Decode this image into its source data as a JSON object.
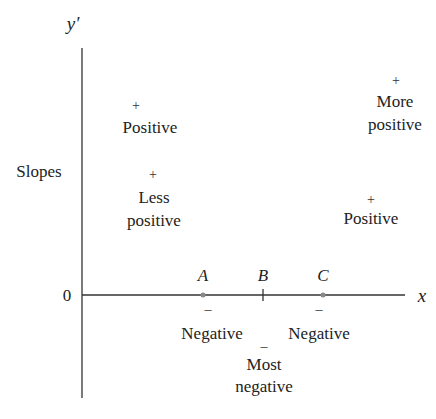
{
  "axes": {
    "y_label": "y′",
    "y_title": "Slopes",
    "zero_label": "0",
    "x_label": "x"
  },
  "points": {
    "A": "A",
    "B": "B",
    "C": "C"
  },
  "annotations": {
    "top_left": {
      "sign": "+",
      "lines": [
        "Positive"
      ]
    },
    "mid_left": {
      "sign": "+",
      "lines": [
        "Less",
        "positive"
      ]
    },
    "top_right": {
      "sign": "+",
      "lines": [
        "More",
        "positive"
      ]
    },
    "mid_right": {
      "sign": "+",
      "lines": [
        "Positive"
      ]
    },
    "at_A": {
      "sign": "–",
      "lines": [
        "Negative"
      ]
    },
    "at_B": {
      "sign": "–",
      "lines": [
        "Most",
        "negative"
      ]
    },
    "at_C": {
      "sign": "–",
      "lines": [
        "Negative"
      ]
    }
  },
  "colors": {
    "axis": "#333333",
    "text": "#222222",
    "dot": "#888888"
  }
}
